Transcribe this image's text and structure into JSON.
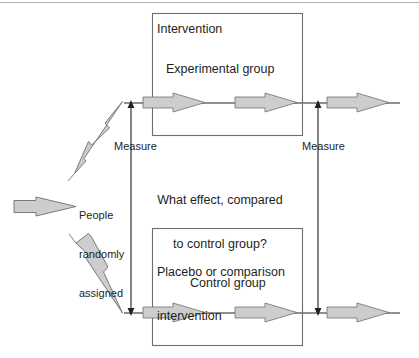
{
  "diagram": {
    "top_rule_color": "#b3b3b3",
    "arrow_fill": "#cdcdcd",
    "arrow_stroke": "#6e6e6e",
    "box_stroke": "#6e6e6e",
    "line_color": "#231f20",
    "text_color": "#231f20",
    "background": "#ffffff",
    "boxes": [
      {
        "name": "experimental-box",
        "heading": "Intervention",
        "group_label": "Experimental group"
      },
      {
        "name": "control-box",
        "heading": "Placebo or comparison\ninterventio",
        "heading_line1": "Placebo or comparison",
        "heading_line2": "intervention",
        "group_label": "Control group"
      }
    ],
    "labels": {
      "measure_left": "Measure",
      "measure_right": "Measure",
      "question_line1": "What effect, compared",
      "question_line2": "to control group?",
      "people_line1": "People",
      "people_line2": "randomly",
      "people_line3": "assigned"
    }
  }
}
